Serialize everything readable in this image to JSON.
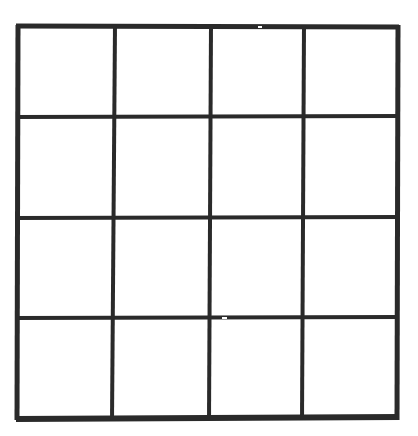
{
  "figure": {
    "background_color": "#ffffff",
    "line_color": "#2a2a2a",
    "canvas": {
      "width": 418,
      "height": 436
    }
  },
  "grid": {
    "rows": 4,
    "columns": 4,
    "cell_count": 16,
    "bounds": {
      "left": 17,
      "top": 26,
      "right": 398,
      "bottom": 419
    },
    "border_stroke_width": 5,
    "interior_stroke_width": 4,
    "bottom_border_stroke_width": 6,
    "vertical_lines": [
      {
        "name": "v0-left-border",
        "x_top": 18,
        "x_bottom": 17,
        "width": 5
      },
      {
        "name": "v1",
        "x_top": 115,
        "x_bottom": 112,
        "width": 4
      },
      {
        "name": "v2",
        "x_top": 211,
        "x_bottom": 209,
        "width": 4
      },
      {
        "name": "v3",
        "x_top": 304,
        "x_bottom": 302,
        "width": 4
      },
      {
        "name": "v4-right-border",
        "x_top": 398,
        "x_bottom": 397,
        "width": 5
      }
    ],
    "horizontal_lines": [
      {
        "name": "h0-top-border",
        "y_left": 26,
        "y_right": 27,
        "width": 5
      },
      {
        "name": "h1",
        "y_left": 117,
        "y_right": 116,
        "width": 4
      },
      {
        "name": "h2",
        "y_left": 218,
        "y_right": 217,
        "width": 4
      },
      {
        "name": "h3",
        "y_left": 318,
        "y_right": 317,
        "width": 4
      },
      {
        "name": "h4-bottom-border",
        "y_left": 419,
        "y_right": 417,
        "width": 6
      }
    ],
    "cells": [
      {
        "row": 1,
        "col": 1,
        "label": ""
      },
      {
        "row": 1,
        "col": 2,
        "label": ""
      },
      {
        "row": 1,
        "col": 3,
        "label": ""
      },
      {
        "row": 1,
        "col": 4,
        "label": ""
      },
      {
        "row": 2,
        "col": 1,
        "label": ""
      },
      {
        "row": 2,
        "col": 2,
        "label": ""
      },
      {
        "row": 2,
        "col": 3,
        "label": ""
      },
      {
        "row": 2,
        "col": 4,
        "label": ""
      },
      {
        "row": 3,
        "col": 1,
        "label": ""
      },
      {
        "row": 3,
        "col": 2,
        "label": ""
      },
      {
        "row": 3,
        "col": 3,
        "label": ""
      },
      {
        "row": 3,
        "col": 4,
        "label": ""
      },
      {
        "row": 4,
        "col": 1,
        "label": ""
      },
      {
        "row": 4,
        "col": 2,
        "label": ""
      },
      {
        "row": 4,
        "col": 3,
        "label": ""
      },
      {
        "row": 4,
        "col": 4,
        "label": ""
      }
    ],
    "artifacts": [
      {
        "name": "top-border-gap",
        "x": 258,
        "y": 27,
        "length": 4
      },
      {
        "name": "h3-line-gap",
        "x": 222,
        "y": 318,
        "length": 5
      }
    ]
  }
}
